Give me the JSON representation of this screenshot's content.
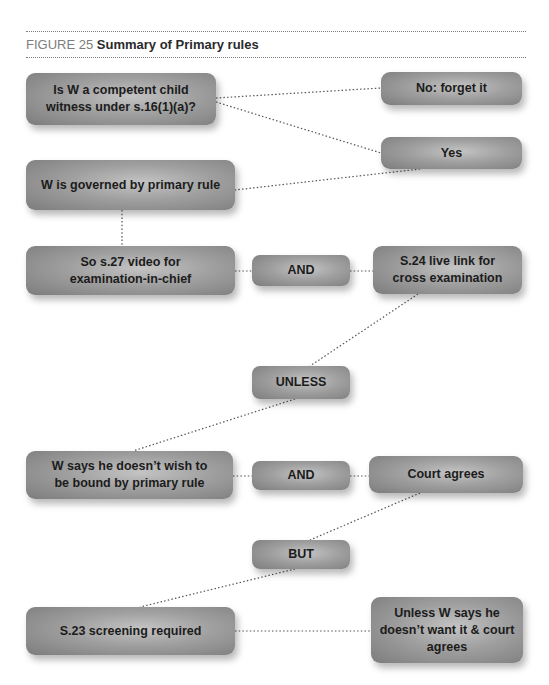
{
  "figure": {
    "number_label": "FIGURE 25",
    "title": "Summary of Primary rules"
  },
  "nodes": {
    "competent_question": "Is W a competent child witness under s.16(1)(a)?",
    "no_forget": "No: forget it",
    "yes": "Yes",
    "governed": "W is governed by primary rule",
    "s27_video": "So s.27 video for examination-in-chief",
    "and_1": "AND",
    "s24_link": "S.24 live link for cross examination",
    "unless": "UNLESS",
    "w_says": "W says he doesn’t wish to be bound by primary rule",
    "and_2": "AND",
    "court_agrees": "Court agrees",
    "but": "BUT",
    "s23_screening": "S.23 screening required",
    "unless_w_says": "Unless W says he doesn’t want it & court agrees"
  },
  "connectors": [
    {
      "from": "competent_question",
      "to": "no_forget"
    },
    {
      "from": "competent_question",
      "to": "yes"
    },
    {
      "from": "yes",
      "to": "governed"
    },
    {
      "from": "governed",
      "to": "s27_video"
    },
    {
      "from": "s27_video",
      "to": "and_1"
    },
    {
      "from": "and_1",
      "to": "s24_link"
    },
    {
      "from": "s24_link",
      "to": "unless"
    },
    {
      "from": "unless",
      "to": "w_says"
    },
    {
      "from": "w_says",
      "to": "and_2"
    },
    {
      "from": "and_2",
      "to": "court_agrees"
    },
    {
      "from": "court_agrees",
      "to": "but"
    },
    {
      "from": "but",
      "to": "s23_screening"
    },
    {
      "from": "s23_screening",
      "to": "unless_w_says"
    }
  ],
  "colors": {
    "node_fill_light": "#c4c4c4",
    "node_fill_dark": "#7c7c7c",
    "node_text": "#1c1c1c",
    "connector": "#555555",
    "caption_label": "#7d7d7d"
  }
}
